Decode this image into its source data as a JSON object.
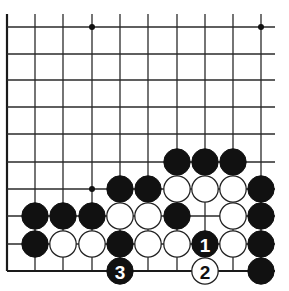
{
  "diagram": {
    "type": "go-board-partial",
    "view": "lower-left region, board edges on left and bottom",
    "columns": 10,
    "rows": 10,
    "geometry": {
      "col_x": [
        7,
        35,
        63,
        92,
        120,
        148,
        177,
        205,
        233,
        261
      ],
      "row_y": [
        27,
        54,
        80,
        107,
        134,
        162,
        189,
        216,
        244,
        271
      ],
      "line_top_extent": 14,
      "line_right_extent": 275,
      "stone_radius": 13.2,
      "star_radius": 3
    },
    "edges": [
      "left",
      "bottom"
    ],
    "star_points": [
      {
        "col": 3,
        "row": 0
      },
      {
        "col": 9,
        "row": 0
      },
      {
        "col": 3,
        "row": 6
      }
    ],
    "stones": [
      {
        "col": 6,
        "row": 5,
        "color": "black"
      },
      {
        "col": 7,
        "row": 5,
        "color": "black"
      },
      {
        "col": 8,
        "row": 5,
        "color": "black"
      },
      {
        "col": 4,
        "row": 6,
        "color": "black"
      },
      {
        "col": 5,
        "row": 6,
        "color": "black"
      },
      {
        "col": 6,
        "row": 6,
        "color": "white"
      },
      {
        "col": 7,
        "row": 6,
        "color": "white"
      },
      {
        "col": 8,
        "row": 6,
        "color": "white"
      },
      {
        "col": 9,
        "row": 6,
        "color": "black"
      },
      {
        "col": 1,
        "row": 7,
        "color": "black"
      },
      {
        "col": 2,
        "row": 7,
        "color": "black"
      },
      {
        "col": 3,
        "row": 7,
        "color": "black"
      },
      {
        "col": 4,
        "row": 7,
        "color": "white"
      },
      {
        "col": 5,
        "row": 7,
        "color": "white"
      },
      {
        "col": 6,
        "row": 7,
        "color": "black"
      },
      {
        "col": 8,
        "row": 7,
        "color": "white"
      },
      {
        "col": 9,
        "row": 7,
        "color": "black"
      },
      {
        "col": 1,
        "row": 8,
        "color": "black"
      },
      {
        "col": 2,
        "row": 8,
        "color": "white"
      },
      {
        "col": 3,
        "row": 8,
        "color": "white"
      },
      {
        "col": 4,
        "row": 8,
        "color": "black"
      },
      {
        "col": 5,
        "row": 8,
        "color": "white"
      },
      {
        "col": 6,
        "row": 8,
        "color": "white"
      },
      {
        "col": 7,
        "row": 8,
        "color": "black",
        "label": "1"
      },
      {
        "col": 8,
        "row": 8,
        "color": "white"
      },
      {
        "col": 9,
        "row": 8,
        "color": "black"
      },
      {
        "col": 4,
        "row": 9,
        "color": "black",
        "label": "3"
      },
      {
        "col": 7,
        "row": 9,
        "color": "white",
        "label": "2"
      },
      {
        "col": 9,
        "row": 9,
        "color": "black"
      }
    ],
    "move_sequence": [
      {
        "number": "1",
        "color": "black",
        "col": 7,
        "row": 8
      },
      {
        "number": "2",
        "color": "white",
        "col": 7,
        "row": 9
      },
      {
        "number": "3",
        "color": "black",
        "col": 4,
        "row": 9
      }
    ],
    "colors": {
      "background": "#ffffff",
      "line": "#2a2a2a",
      "black_stone": "#111111",
      "white_stone": "#ffffff"
    }
  }
}
